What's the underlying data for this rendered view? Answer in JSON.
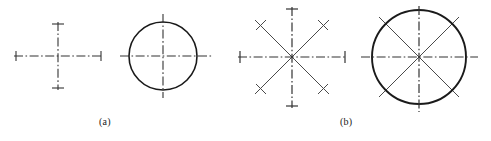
{
  "figure": {
    "width": 491,
    "height": 141,
    "background_color": "#ffffff",
    "line_color": "#1a1a1a",
    "centerline_color": "#333333",
    "diagonal_color": "#4a4a4a"
  },
  "panels": [
    {
      "id": "a",
      "caption": "(a)",
      "caption_position": {
        "x": 99,
        "y": 116
      },
      "description": "Single-axis centerline cross shown alone and applied to a circle",
      "items": [
        {
          "name": "centerline-cross",
          "type": "cross",
          "center": {
            "x": 58,
            "y": 56
          },
          "horizontal_span": {
            "x1": 14,
            "x2": 103
          },
          "vertical_span": {
            "y1": 22,
            "y2": 90
          },
          "line_style": "dash-dot",
          "end_caps": "short-perpendicular-tick"
        },
        {
          "name": "circle-with-centerlines",
          "type": "circle",
          "center": {
            "x": 163,
            "y": 56
          },
          "radius": 34,
          "circle_line_style": "solid",
          "centerline_overhang": 15,
          "centerline_style": "dash-dot",
          "horizontal_span": {
            "x1": 120,
            "x2": 212
          },
          "vertical_span": {
            "y1": 14,
            "y2": 98
          }
        }
      ]
    },
    {
      "id": "b",
      "caption": "(b)",
      "caption_position": {
        "x": 340,
        "y": 116
      },
      "description": "Eight-spoke bolt-circle centerline pattern shown alone and applied to a circle",
      "items": [
        {
          "name": "eight-spoke-star",
          "type": "star",
          "center": {
            "x": 292,
            "y": 57
          },
          "spoke_count": 8,
          "horizontal_span": {
            "x1": 238,
            "x2": 346
          },
          "vertical_span": {
            "y1": 7,
            "y2": 108
          },
          "diagonal_radius": 52,
          "diagonal_angles_deg": [
            45,
            135,
            225,
            315
          ],
          "axis_line_style": "dash-dot",
          "diagonal_line_style": "solid",
          "diagonal_end_caps": "short-perpendicular-tick",
          "axis_end_caps": "short-perpendicular-tick"
        },
        {
          "name": "circle-with-eight-spokes",
          "type": "circle",
          "center": {
            "x": 419,
            "y": 57
          },
          "radius": 47,
          "circle_line_style": "solid",
          "centerline_overhang": 11,
          "horizontal_span": {
            "x1": 361,
            "x2": 478
          },
          "vertical_span": {
            "y1": 6,
            "y2": 112
          },
          "diagonal_radius": 56,
          "diagonal_angles_deg": [
            45,
            135,
            225,
            315
          ],
          "axis_line_style": "dash-dot",
          "diagonal_line_style": "solid"
        }
      ]
    }
  ]
}
